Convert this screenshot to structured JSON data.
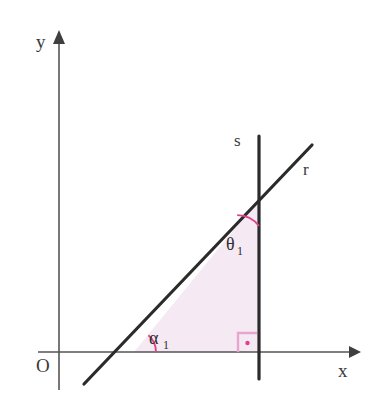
{
  "figure": {
    "background_color": "#ffffff"
  },
  "colors": {
    "axis": "#555555",
    "line": "#2b2b2b",
    "angle_arc": "#e0418c",
    "triangle_fill": "#f5e9f4",
    "right_angle": "#e9a6cd",
    "text": "#3a3a3a"
  },
  "axes": {
    "x_axis": {
      "label": "x",
      "label_x": 338,
      "label_y": 377,
      "y": 352,
      "x_start": 38,
      "x_end": 355
    },
    "y_axis": {
      "label": "y",
      "label_x": 36,
      "label_y": 48,
      "x": 59,
      "y_start": 32,
      "y_end": 390
    },
    "origin": {
      "label": "O",
      "label_x": 36,
      "label_y": 372
    }
  },
  "lines": [
    {
      "name": "r",
      "label": "r",
      "label_x": 303,
      "label_y": 175,
      "x1": 84,
      "y1": 384,
      "x2": 312,
      "y2": 145
    },
    {
      "name": "s",
      "label": "s",
      "label_x": 234,
      "label_y": 146,
      "x1": 259,
      "y1": 136,
      "x2": 259,
      "y2": 379
    }
  ],
  "triangle": {
    "vertices": "134,352 259,199 259,352",
    "fill": "#f5e9f4"
  },
  "angles": [
    {
      "name": "alpha-1",
      "label": "α",
      "subscript": "1",
      "label_x": 149,
      "label_y": 344,
      "vertex_x": 134,
      "vertex_y": 352,
      "arc_path": "M 156 352 A 22 22 0 0 0 148.5 335.0"
    },
    {
      "name": "theta-1",
      "label": "θ",
      "subscript": "1",
      "label_x": 226,
      "label_y": 250,
      "vertex_x": 259,
      "vertex_y": 199,
      "arc_path": "M 259 226 A 27 27 0 0 0 237.0 215.5"
    }
  ],
  "right_angle_marker": {
    "name": "right-angle-at-foot",
    "outer": "238,352 238,333 257,333",
    "dot_x": 247.5,
    "dot_y": 343,
    "dot_r": 2.2
  }
}
